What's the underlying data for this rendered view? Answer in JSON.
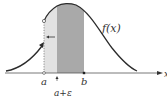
{
  "diagram": {
    "curve_label": "f(x)",
    "axis_label": "x",
    "tick_labels": {
      "a": "a",
      "a_plus_eps": "a+ε",
      "b": "b"
    },
    "colors": {
      "curve": "#2b2b2b",
      "light_region": "#e2e2e2",
      "dark_region": "#a9a9a9",
      "axis": "#555555"
    }
  }
}
